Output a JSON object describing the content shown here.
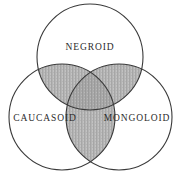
{
  "diagram": {
    "background_color": "#ffffff",
    "stroke_color": "#3a3a3a",
    "shade_color": "#b4b4b4",
    "shade_color_dark": "#9e9e9e",
    "label_color": "#2b2b2b",
    "sets": [
      {
        "id": "negroid",
        "label": "NEGROID",
        "cx": 90,
        "cy": 57,
        "r": 53,
        "label_x": 90,
        "label_y": 48
      },
      {
        "id": "caucasoid",
        "label": "CAUCASOID",
        "cx": 62,
        "cy": 117,
        "r": 53,
        "label_x": 45,
        "label_y": 119
      },
      {
        "id": "mongoloid",
        "label": "MONGOLOID",
        "cx": 119,
        "cy": 117,
        "r": 53,
        "label_x": 137,
        "label_y": 119
      }
    ],
    "intersections": [
      {
        "id": "negroid-caucasoid",
        "sets": [
          "negroid",
          "caucasoid"
        ],
        "shaded": true
      },
      {
        "id": "negroid-mongoloid",
        "sets": [
          "negroid",
          "mongoloid"
        ],
        "shaded": true
      },
      {
        "id": "caucasoid-mongoloid",
        "sets": [
          "caucasoid",
          "mongoloid"
        ],
        "shaded": true
      },
      {
        "id": "negroid-caucasoid-mongoloid",
        "sets": [
          "negroid",
          "caucasoid",
          "mongoloid"
        ],
        "shaded": true
      }
    ]
  }
}
